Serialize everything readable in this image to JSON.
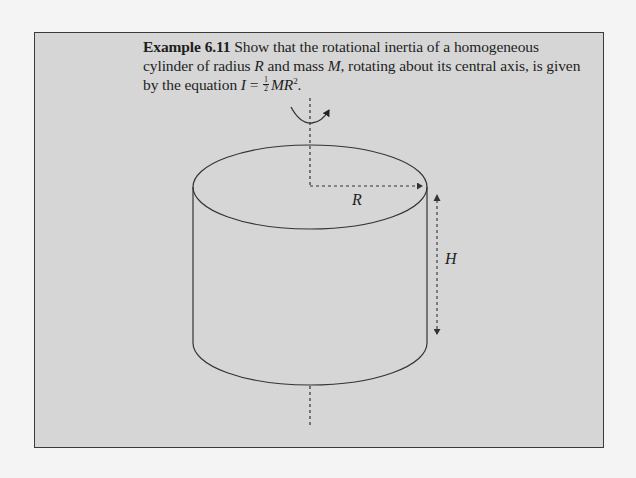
{
  "example": {
    "label": "Example 6.11",
    "text_part1": " Show that the rotational inertia of a homogeneous cylinder of radius ",
    "var_R": "R",
    "text_part2": " and mass ",
    "var_M": "M",
    "text_part3": ", rotating about its central axis, is given by the equation ",
    "var_I": "I",
    "equals": " = ",
    "frac_num": "1",
    "frac_den": "2",
    "var_MR": "MR",
    "exponent": "2",
    "period": "."
  },
  "diagram": {
    "radius_label": "R",
    "height_label": "H",
    "line_color": "#333333",
    "box_fill": "#d6d6d6",
    "page_bg": "#f4f4f4"
  }
}
